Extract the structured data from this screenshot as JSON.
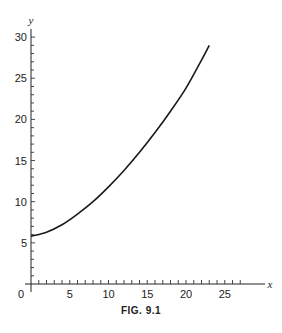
{
  "caption": "FIG. 9.1",
  "chart_data": {
    "type": "line",
    "title": "",
    "caption": "FIG. 9.1",
    "xlabel": "x",
    "ylabel": "y",
    "xlim": [
      0,
      28
    ],
    "ylim": [
      0,
      31
    ],
    "x_ticks": [
      0,
      5,
      10,
      15,
      20,
      25
    ],
    "y_ticks": [
      5,
      10,
      15,
      20,
      25,
      30
    ],
    "minor_tick_step": 1,
    "grid": false,
    "legend": null,
    "series": [
      {
        "name": "curve",
        "x": [
          0,
          2,
          4,
          6,
          8,
          10,
          12,
          14,
          16,
          18,
          20,
          22,
          23
        ],
        "y": [
          5.8,
          6.3,
          7.2,
          8.5,
          10.0,
          11.8,
          13.8,
          16.0,
          18.4,
          21.0,
          23.8,
          27.2,
          29.0
        ]
      }
    ]
  }
}
